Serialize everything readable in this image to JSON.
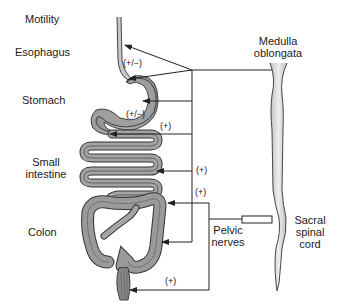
{
  "diagram": {
    "header": {
      "title": "Motility"
    },
    "organ_labels": [
      {
        "id": "esophagus",
        "text": "Esophagus"
      },
      {
        "id": "stomach",
        "text": "Stomach"
      },
      {
        "id": "small_intestine_1",
        "text": "Small"
      },
      {
        "id": "small_intestine_2",
        "text": "intestine"
      },
      {
        "id": "colon",
        "text": "Colon"
      }
    ],
    "cns_labels": {
      "medulla_1": "Medulla",
      "medulla_2": "oblongata",
      "sacral_1": "Sacral",
      "sacral_2": "spinal",
      "sacral_3": "cord",
      "pelvic_1": "Pelvic",
      "pelvic_2": "nerves"
    },
    "effects": {
      "esophagus": "(+/−)",
      "stomach": "(+/−)",
      "small_intestine_top": "(+)",
      "small_intestine": "(+)",
      "colon": "(+)",
      "rectum": "(+)"
    },
    "colors": {
      "line": "#222222",
      "organ_fill": "#9a9a9a",
      "organ_stroke": "#333333",
      "cord_fill": "#dcdcdc"
    }
  }
}
